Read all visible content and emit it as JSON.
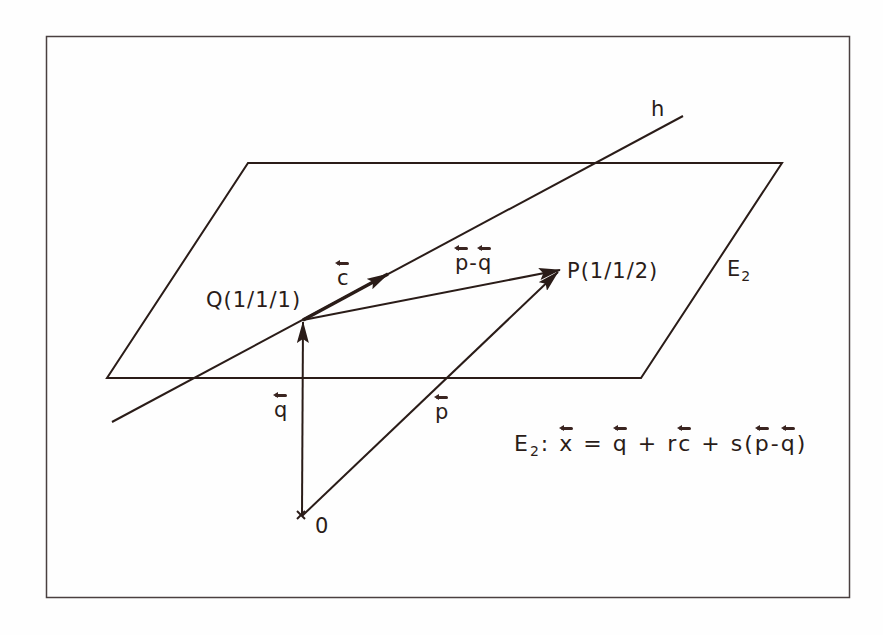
{
  "diagram": {
    "colors": {
      "ink": "#2a1c18",
      "frame": "#4a4040",
      "background": "#fefefe"
    },
    "labels": {
      "line": "h",
      "plane": "E",
      "plane_sub": "2",
      "point_Q": "Q(1/1/1)",
      "point_P": "P(1/1/2)",
      "origin": "0",
      "vec_c": "c",
      "vec_q": "q",
      "vec_p": "p",
      "vec_pq_p": "p",
      "vec_pq_minus": "-",
      "vec_pq_q": "q"
    },
    "equation": {
      "E": "E",
      "sub": "2",
      "colon": ":",
      "x": "x",
      "eq": "=",
      "q1": "q",
      "plus1": "+",
      "r": "r",
      "c": "c",
      "plus2": "+",
      "s": "s",
      "lparen": "(",
      "p": "p",
      "minus": "-",
      "q2": "q",
      "rparen": ")"
    },
    "geometry": {
      "frame": [
        46,
        36,
        850,
        598
      ],
      "plane": [
        [
          248,
          163
        ],
        [
          782,
          163
        ],
        [
          641,
          378
        ],
        [
          107,
          378
        ]
      ],
      "line_h": [
        [
          112,
          422
        ],
        [
          683,
          116
        ]
      ],
      "Q": [
        303,
        320
      ],
      "P": [
        560,
        270
      ],
      "O": [
        302,
        516
      ]
    }
  }
}
